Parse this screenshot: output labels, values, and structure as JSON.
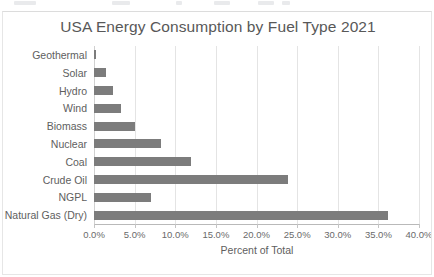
{
  "chart_data": {
    "type": "bar",
    "orientation": "horizontal",
    "title": "USA Energy Consumption by Fuel Type 2021",
    "xlabel": "Percent of Total",
    "ylabel": "",
    "xlim": [
      0,
      40
    ],
    "grid": true,
    "legend": false,
    "bar_color": "#7c7c7c",
    "gridline_color": "#e4e4e4",
    "categories": [
      "Geothermal",
      "Solar",
      "Hydro",
      "Wind",
      "Biomass",
      "Nuclear",
      "Coal",
      "Crude Oil",
      "NGPL",
      "Natural Gas (Dry)"
    ],
    "values": [
      0.2,
      1.5,
      2.3,
      3.3,
      5.1,
      8.3,
      11.9,
      23.9,
      7.0,
      36.2
    ],
    "xticks": [
      0,
      5,
      10,
      15,
      20,
      25,
      30,
      35,
      40
    ],
    "xticklabels": [
      "0.0%",
      "5.0%",
      "10.0%",
      "15.0%",
      "20.0%",
      "25.0%",
      "30.0%",
      "35.0%",
      "40.0%"
    ]
  },
  "top_strip": {
    "smudges": [
      {
        "left": 14,
        "width": 22
      },
      {
        "left": 112,
        "width": 18
      },
      {
        "left": 176,
        "width": 6
      },
      {
        "left": 214,
        "width": 16
      },
      {
        "left": 258,
        "width": 16
      },
      {
        "left": 282,
        "width": 8
      }
    ]
  }
}
